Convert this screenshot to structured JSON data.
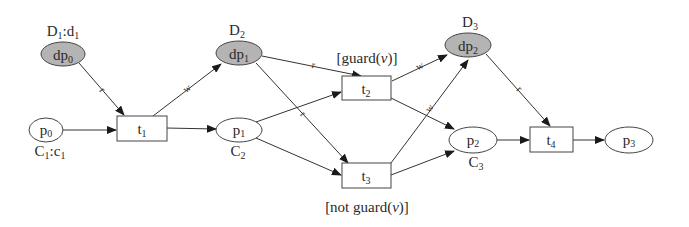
{
  "diagram": {
    "type": "petri-net",
    "colors": {
      "data_place_fill": "#b4b4b4",
      "place_fill": "#ffffff",
      "stroke": "#333333",
      "text": "#2a2a2a"
    },
    "data_places": [
      {
        "id": "dp0",
        "label": "dp",
        "sub": "0",
        "domain": "D",
        "domain_sub": "1",
        "domain_suffix": ":d",
        "domain_suffix_sub": "1"
      },
      {
        "id": "dp1",
        "label": "dp",
        "sub": "1",
        "domain": "D",
        "domain_sub": "2"
      },
      {
        "id": "dp2",
        "label": "dp",
        "sub": "2",
        "domain": "D",
        "domain_sub": "3"
      }
    ],
    "places": [
      {
        "id": "p0",
        "label": "p",
        "sub": "0",
        "color": "C",
        "color_sub": "1",
        "color_suffix": ":c",
        "color_suffix_sub": "1"
      },
      {
        "id": "p1",
        "label": "p",
        "sub": "1",
        "color": "C",
        "color_sub": "2"
      },
      {
        "id": "p2",
        "label": "p",
        "sub": "2",
        "color": "C",
        "color_sub": "3"
      },
      {
        "id": "p3",
        "label": "p",
        "sub": "3"
      }
    ],
    "transitions": [
      {
        "id": "t1",
        "label": "t",
        "sub": "1"
      },
      {
        "id": "t2",
        "label": "t",
        "sub": "2",
        "guard": "[guard(",
        "guard_var": "v",
        "guard_end": ")]"
      },
      {
        "id": "t3",
        "label": "t",
        "sub": "3",
        "guard": "[not guard(",
        "guard_var": "v",
        "guard_end": ")]"
      },
      {
        "id": "t4",
        "label": "t",
        "sub": "4"
      }
    ],
    "arcs": [
      {
        "from": "p0",
        "to": "t1",
        "label": ""
      },
      {
        "from": "t1",
        "to": "p1",
        "label": ""
      },
      {
        "from": "dp0",
        "to": "t1",
        "label": "r"
      },
      {
        "from": "t1",
        "to": "dp1",
        "label": "w"
      },
      {
        "from": "dp1",
        "to": "t2",
        "label": "r"
      },
      {
        "from": "dp1",
        "to": "t3",
        "label": "r"
      },
      {
        "from": "p1",
        "to": "t2",
        "label": ""
      },
      {
        "from": "p1",
        "to": "t3",
        "label": ""
      },
      {
        "from": "t2",
        "to": "dp2",
        "label": "w"
      },
      {
        "from": "t3",
        "to": "dp2",
        "label": "w"
      },
      {
        "from": "t2",
        "to": "p2",
        "label": ""
      },
      {
        "from": "t3",
        "to": "p2",
        "label": ""
      },
      {
        "from": "dp2",
        "to": "t4",
        "label": "r"
      },
      {
        "from": "p2",
        "to": "t4",
        "label": ""
      },
      {
        "from": "t4",
        "to": "p3",
        "label": ""
      }
    ],
    "arc_labels": {
      "read": "r",
      "write": "w"
    }
  }
}
